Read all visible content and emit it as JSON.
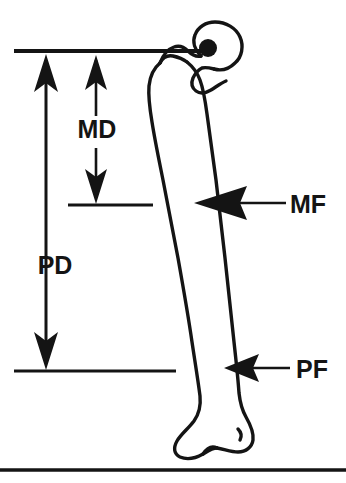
{
  "figure": {
    "background_color": "#ffffff",
    "line_color": "#141414",
    "labels": {
      "md": "MD",
      "pd": "PD",
      "mf": "MF",
      "pf": "PF"
    },
    "reference_lines": [
      {
        "name": "proximal-reference-line",
        "y": 51,
        "x1": 14,
        "x2": 208
      },
      {
        "name": "mid-reference-line",
        "y": 205,
        "x1": 68,
        "x2": 153
      },
      {
        "name": "distal-reference-line",
        "y": 371,
        "x1": 14,
        "x2": 176
      },
      {
        "name": "baseline-rule",
        "y": 470,
        "x1": 0,
        "x2": 346
      }
    ],
    "measurements": [
      {
        "name": "md-measurement",
        "label": "MD",
        "type": "vertical-double-arrow",
        "x": 96,
        "y_top": 51,
        "y_bottom": 205,
        "label_x": 97,
        "label_y": 138
      },
      {
        "name": "pd-measurement",
        "label": "PD",
        "type": "vertical-double-arrow",
        "x": 46,
        "y_top": 51,
        "y_bottom": 371,
        "label_x": 55,
        "label_y": 274
      },
      {
        "name": "mf-callout",
        "label": "MF",
        "type": "horizontal-arrow-left",
        "y": 203,
        "x_tail": 290,
        "x_tip": 196,
        "label_x": 290,
        "label_y": 212
      },
      {
        "name": "pf-callout",
        "label": "PF",
        "type": "horizontal-arrow-left",
        "y": 368,
        "x_tail": 292,
        "x_tip": 224,
        "label_x": 296,
        "label_y": 378
      }
    ],
    "anatomy": {
      "femoral_head_center": {
        "name": "femoral-head-center-marker",
        "cx": 208,
        "cy": 48,
        "r": 9
      }
    }
  }
}
